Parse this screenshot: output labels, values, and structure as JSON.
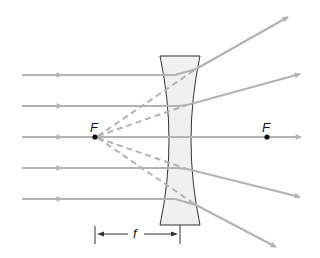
{
  "diagram": {
    "colors": {
      "ray": "#b3b3b3",
      "lens_fill": "#f0f0f0",
      "lens_stroke": "#333333",
      "focal_point": "#111111",
      "dimension": "#333333"
    },
    "labels": {
      "focal_left": "F",
      "focal_right": "F",
      "focal_length": "f"
    },
    "incident_rays_y": [
      75,
      106,
      137,
      168,
      199
    ],
    "focal_points": [
      {
        "name": "F-left",
        "x": 95,
        "y": 137
      },
      {
        "name": "F-right",
        "x": 267,
        "y": 137
      }
    ],
    "lens": {
      "left": 160,
      "right": 200,
      "top": 56,
      "bottom": 225,
      "waist_left": 172,
      "waist_right": 188
    }
  }
}
